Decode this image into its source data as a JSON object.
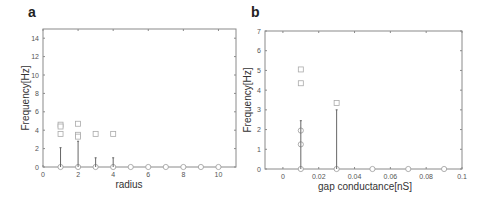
{
  "panels": {
    "a": {
      "label": "a"
    },
    "b": {
      "label": "b"
    }
  },
  "chart_data": [
    {
      "type": "scatter",
      "panel": "a",
      "title": "",
      "xlabel": "radius",
      "ylabel": "Frequency[Hz]",
      "xlim": [
        0,
        11
      ],
      "ylim": [
        0,
        15
      ],
      "xticks": [
        0,
        2,
        4,
        6,
        8,
        10
      ],
      "yticks": [
        0,
        2,
        4,
        6,
        8,
        10,
        12,
        14
      ],
      "grid": false,
      "series": [
        {
          "name": "circles (mean)",
          "marker": "circle",
          "points": [
            [
              1,
              0
            ],
            [
              2,
              0
            ],
            [
              3,
              0
            ],
            [
              4,
              0
            ],
            [
              5,
              0
            ],
            [
              6,
              0
            ],
            [
              7,
              0
            ],
            [
              8,
              0
            ],
            [
              9,
              0
            ],
            [
              10,
              0
            ]
          ]
        },
        {
          "name": "squares",
          "marker": "square",
          "points": [
            [
              1,
              4.6
            ],
            [
              1,
              4.4
            ],
            [
              1,
              3.6
            ],
            [
              2,
              4.7
            ],
            [
              2,
              3.5
            ],
            [
              2,
              3.3
            ],
            [
              3,
              3.6
            ],
            [
              4,
              3.6
            ]
          ]
        },
        {
          "name": "error bars",
          "marker": "errorbar",
          "bars": [
            [
              1,
              0,
              2.1
            ],
            [
              2,
              0,
              2.8
            ],
            [
              3,
              0,
              1.0
            ],
            [
              4,
              0,
              1.0
            ]
          ]
        }
      ]
    },
    {
      "type": "scatter",
      "panel": "b",
      "title": "",
      "xlabel": "gap conductance[nS]",
      "ylabel": "Frequency[Hz]",
      "xlim": [
        -0.01,
        0.1
      ],
      "ylim": [
        0,
        7
      ],
      "xticks": [
        0,
        0.02,
        0.04,
        0.06,
        0.08,
        0.1
      ],
      "xticklabels": [
        "0",
        "0.02",
        "0.04",
        "0.06",
        "0.08",
        "0.1"
      ],
      "yticks": [
        0,
        1,
        2,
        3,
        4,
        5,
        6,
        7
      ],
      "grid": false,
      "series": [
        {
          "name": "circles (mean)",
          "marker": "circle",
          "points": [
            [
              0.01,
              0
            ],
            [
              0.01,
              1.25
            ],
            [
              0.01,
              1.95
            ],
            [
              0.03,
              0
            ],
            [
              0.05,
              0
            ],
            [
              0.07,
              0
            ],
            [
              0.09,
              0
            ]
          ]
        },
        {
          "name": "squares",
          "marker": "square",
          "points": [
            [
              0.01,
              5.05
            ],
            [
              0.01,
              4.35
            ],
            [
              0.03,
              3.35
            ]
          ]
        },
        {
          "name": "error bars",
          "marker": "errorbar",
          "bars": [
            [
              0.01,
              0,
              2.45
            ],
            [
              0.03,
              0,
              3.0
            ]
          ]
        }
      ]
    }
  ]
}
